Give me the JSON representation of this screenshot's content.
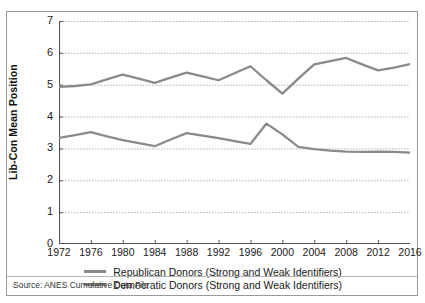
{
  "chart_data": {
    "type": "line",
    "title": "",
    "xlabel": "",
    "ylabel": "Lib-Con Mean Position",
    "xlim": [
      1972,
      2016
    ],
    "ylim": [
      0,
      7
    ],
    "ytick_labels": [
      "7",
      "6",
      "5",
      "4",
      "3",
      "2",
      "1",
      "0"
    ],
    "ytick_values": [
      7,
      6,
      5,
      4,
      3,
      2,
      1,
      0
    ],
    "xtick_labels": [
      "1972",
      "1976",
      "1980",
      "1984",
      "1988",
      "1992",
      "1996",
      "2000",
      "2004",
      "2008",
      "2012",
      "2016"
    ],
    "xtick_values": [
      1972,
      1976,
      1980,
      1984,
      1988,
      1992,
      1996,
      2000,
      2004,
      2008,
      2012,
      2016
    ],
    "grid": "horizontal-dotted",
    "legend_position": "bottom",
    "x": [
      1972,
      1974,
      1976,
      1978,
      1980,
      1982,
      1984,
      1986,
      1988,
      1990,
      1992,
      1994,
      1996,
      1998,
      2000,
      2002,
      2004,
      2006,
      2008,
      2010,
      2012,
      2014,
      2016
    ],
    "series": [
      {
        "name": "Republican Donors (Strong and Weak Identifiers)",
        "color": "#8a8a8a",
        "values": [
          4.93,
          4.96,
          5.01,
          5.17,
          5.32,
          5.19,
          5.06,
          5.22,
          5.38,
          5.26,
          5.14,
          5.36,
          5.58,
          5.14,
          4.72,
          5.19,
          5.64,
          5.74,
          5.84,
          5.64,
          5.45,
          5.54,
          5.65
        ]
      },
      {
        "name": "Democratic Donors (Strong and Weak Identifiers)",
        "color": "#8a8a8a",
        "values": [
          3.33,
          3.42,
          3.51,
          3.38,
          3.26,
          3.17,
          3.07,
          3.28,
          3.48,
          3.4,
          3.32,
          3.23,
          3.14,
          3.78,
          3.44,
          3.05,
          2.98,
          2.93,
          2.9,
          2.89,
          2.9,
          2.89,
          2.87
        ]
      }
    ],
    "source_note": "Source: ANES Cumulative Data File"
  },
  "legend": {
    "entries": [
      {
        "label": "Republican Donors (Strong and Weak Identifiers)",
        "color": "#8a8a8a"
      },
      {
        "label": "Democratic Donors (Strong and Weak Identifiers)",
        "color": "#8a8a8a"
      }
    ]
  },
  "axis": {
    "y_title": "Lib-Con Mean Position"
  },
  "source": {
    "text": "Source: ANES Cumulative Data File"
  },
  "colors": {
    "line": "#8a8a8a",
    "grid": "#b0b0b0",
    "axis": "#555555",
    "border": "#9a9a9a",
    "text": "#1a1a1a"
  }
}
